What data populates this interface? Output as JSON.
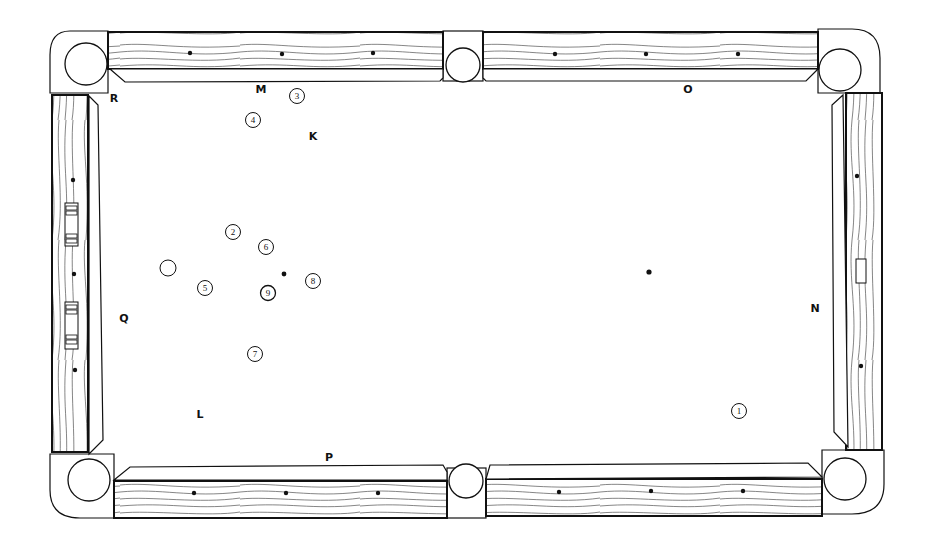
{
  "diagram": {
    "type": "pool-table-layout",
    "colors": {
      "line": "#111111",
      "felt": "#ffffff",
      "wood_grain": "#333333"
    },
    "labels": [
      {
        "id": "R",
        "text": "R",
        "x": 114,
        "y": 102
      },
      {
        "id": "M",
        "text": "M",
        "x": 261,
        "y": 93
      },
      {
        "id": "K",
        "text": "K",
        "x": 313,
        "y": 140
      },
      {
        "id": "O",
        "text": "O",
        "x": 688,
        "y": 93
      },
      {
        "id": "Q",
        "text": "Q",
        "x": 124,
        "y": 322
      },
      {
        "id": "N",
        "text": "N",
        "x": 815,
        "y": 312
      },
      {
        "id": "L",
        "text": "L",
        "x": 200,
        "y": 418
      },
      {
        "id": "P",
        "text": "P",
        "x": 329,
        "y": 461
      }
    ],
    "balls": [
      {
        "number": "1",
        "x": 739,
        "y": 411
      },
      {
        "number": "2",
        "x": 233,
        "y": 232
      },
      {
        "number": "3",
        "x": 297,
        "y": 96
      },
      {
        "number": "4",
        "x": 253,
        "y": 120
      },
      {
        "number": "5",
        "x": 205,
        "y": 288
      },
      {
        "number": "6",
        "x": 266,
        "y": 247
      },
      {
        "number": "7",
        "x": 255,
        "y": 354
      },
      {
        "number": "8",
        "x": 313,
        "y": 281
      },
      {
        "number": "9",
        "x": 268,
        "y": 293
      }
    ],
    "cue_ball": {
      "x": 168,
      "y": 268
    },
    "spots": [
      {
        "name": "head-spot",
        "x": 284,
        "y": 274
      },
      {
        "name": "foot-spot",
        "x": 649,
        "y": 272
      }
    ]
  }
}
